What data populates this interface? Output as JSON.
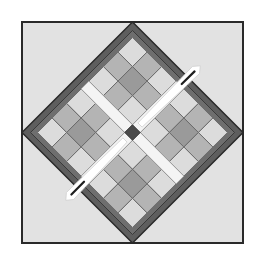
{
  "illustration": {
    "subject": "quilt-block-with-needle",
    "canvas": {
      "width": 262,
      "height": 268,
      "background": "#ffffff"
    },
    "outer_square": {
      "x": 22,
      "y": 22,
      "size": 221,
      "fill": "#e2e2e2",
      "stroke": "#2a2a2a",
      "stroke_width": 2
    },
    "diamond": {
      "cx": 132.5,
      "cy": 132.5,
      "half_diag": 110.5
    },
    "colors": {
      "border_dark": "#5e5e5e",
      "border_mid": "#6e6e6e",
      "tile_light": "#dcdcdc",
      "tile_medium": "#b4b4b4",
      "tile_dark_center": "#9a9a9a",
      "tile_line": "#6a6a6a",
      "sash_white": "#f4f4f4",
      "center_square": "#4a4a4a",
      "needle_white": "#ffffff",
      "needle_eye": "#1e1e1e",
      "outline": "#2a2a2a"
    },
    "tile_grid": {
      "cells_per_side": 7,
      "quadrants": 4
    },
    "needles": [
      {
        "name": "upper-right",
        "x1": 140,
        "y1": 125,
        "x2": 196,
        "y2": 70
      },
      {
        "name": "lower-left",
        "x1": 125,
        "y1": 140,
        "x2": 70,
        "y2": 196
      }
    ]
  }
}
